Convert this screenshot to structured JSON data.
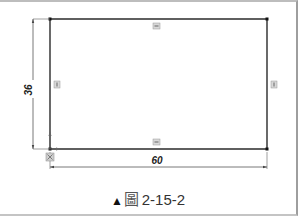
{
  "figure": {
    "caption_marker": "▲",
    "caption_label": "圖",
    "caption_number": "2-15-2"
  },
  "sketch": {
    "shape": "rectangle",
    "width_dimension": "60",
    "height_dimension": "36",
    "constraint_markers": [
      {
        "name": "horizontal-constraint-top",
        "type": "horizontal"
      },
      {
        "name": "horizontal-constraint-bottom",
        "type": "horizontal"
      },
      {
        "name": "vertical-constraint-left",
        "type": "vertical"
      },
      {
        "name": "vertical-constraint-right",
        "type": "vertical"
      },
      {
        "name": "coincident-origin",
        "type": "coincident"
      }
    ]
  },
  "colors": {
    "line": "#2a2a2a",
    "dimension_line": "#555555",
    "constraint_marker": "#8a8a8a",
    "background": "#ffffff"
  }
}
